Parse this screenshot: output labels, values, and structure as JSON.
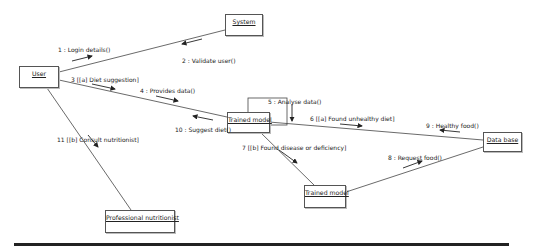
{
  "diagram": {
    "type": "UML communication diagram",
    "nodes": [
      {
        "id": "user",
        "label": "User"
      },
      {
        "id": "system",
        "label": "System"
      },
      {
        "id": "trained_model_1",
        "label": "Trained model"
      },
      {
        "id": "trained_model_2",
        "label": "Trained model"
      },
      {
        "id": "data_base",
        "label": "Data base"
      },
      {
        "id": "professional_nutritionist",
        "label": "Professional nutritionist"
      }
    ],
    "messages": [
      {
        "label": "1 : Login details()",
        "from": "user",
        "to": "system"
      },
      {
        "label": "2 : Validate user()",
        "from": "system",
        "to": "user"
      },
      {
        "label": "3 [[a] Diet suggestion]",
        "from": "user",
        "to": "trained_model_1"
      },
      {
        "label": "4 : Provides data()",
        "from": "user",
        "to": "trained_model_1"
      },
      {
        "label": "5 : Analyse data()",
        "from": "trained_model_1",
        "to": "trained_model_1"
      },
      {
        "label": "6 [[a] Found unhealthy diet]",
        "from": "trained_model_1",
        "to": "data_base"
      },
      {
        "label": "7 [[b] Found disease or deficiency]",
        "from": "trained_model_1",
        "to": "trained_model_2"
      },
      {
        "label": "8 : Request food()",
        "from": "trained_model_2",
        "to": "data_base"
      },
      {
        "label": "9 : Healthy food()",
        "from": "data_base",
        "to": "trained_model_1"
      },
      {
        "label": "10 : Suggest diet()",
        "from": "trained_model_1",
        "to": "user"
      },
      {
        "label": "11 [[b] Consult nutritionist]",
        "from": "user",
        "to": "professional_nutritionist"
      }
    ]
  }
}
